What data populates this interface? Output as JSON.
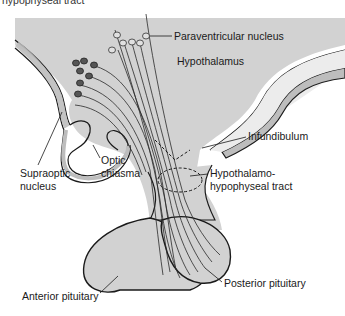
{
  "figure": {
    "cutoff_caption": "hypophyseal tract",
    "colors": {
      "tissue_fill": "#d2d2d2",
      "band_fill": "#bdbdbd",
      "light_band": "#ececec",
      "outline": "#1a1a1a",
      "nucleus_dark": "#555555",
      "nucleus_light": "#e0e0e0"
    }
  },
  "labels": {
    "paraventricular": "Paraventricular nucleus",
    "hypothalamus": "Hypothalamus",
    "infundibulum": "Infundibulum",
    "supraoptic_line1": "Supraoptic",
    "supraoptic_line2": "nucleus",
    "optic_line1": "Optic",
    "optic_line2": "chiasma",
    "tract_line1": "Hypothalamo-",
    "tract_line2": "hypophyseal tract",
    "posterior": "Posterior pituitary",
    "anterior": "Anterior pituitary"
  }
}
